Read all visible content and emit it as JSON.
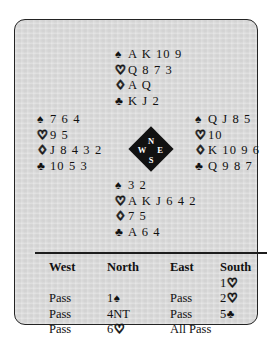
{
  "diagram": {
    "card_background": "#d8d8d8",
    "border_color": "#232323",
    "suit_glyphs": {
      "spade": "♠",
      "heart": "♡",
      "diamond": "♢",
      "club": "♣"
    },
    "compass": {
      "north": "N",
      "west": "W",
      "east": "E",
      "south": "S"
    },
    "hands": {
      "north": {
        "label": "North",
        "spades_sym": "♠",
        "spades": "A K 10 9",
        "hearts_sym": "♡",
        "hearts": "Q 8 7 3",
        "diamonds_sym": "♢",
        "diamonds": "A Q",
        "clubs_sym": "♣",
        "clubs": "K J 2"
      },
      "west": {
        "label": "West",
        "spades_sym": "♠",
        "spades": "7 6 4",
        "hearts_sym": "♡",
        "hearts": "9 5",
        "diamonds_sym": "♢",
        "diamonds": "J 8 4 3 2",
        "clubs_sym": "♣",
        "clubs": "10 5 3"
      },
      "east": {
        "label": "East",
        "spades_sym": "♠",
        "spades": "Q J 8 5",
        "hearts_sym": "♡",
        "hearts": "10",
        "diamonds_sym": "♢",
        "diamonds": "K 10 9 6",
        "clubs_sym": "♣",
        "clubs": "Q 9 8 7"
      },
      "south": {
        "label": "South",
        "spades_sym": "♠",
        "spades": "3 2",
        "hearts_sym": "♡",
        "hearts": "A K J 6 4 2",
        "diamonds_sym": "♢",
        "diamonds": "7 5",
        "clubs_sym": "♣",
        "clubs": "A 6 4"
      }
    },
    "auction": {
      "headers": {
        "west": "West",
        "north": "North",
        "east": "East",
        "south": "South"
      },
      "rows": [
        {
          "west": "",
          "north": "",
          "east": "",
          "south_level": "1",
          "south_sym": "♡"
        },
        {
          "west": "Pass",
          "north_level": "1",
          "north_sym": "♠",
          "east": "Pass",
          "south_level": "2",
          "south_sym": "♡"
        },
        {
          "west": "Pass",
          "north_level": "4NT",
          "north_sym": "",
          "east": "Pass",
          "south_level": "5",
          "south_sym": "♣"
        },
        {
          "west": "Pass",
          "north_level": "6",
          "north_sym": "♡",
          "east": "All Pass",
          "south_level": "",
          "south_sym": ""
        }
      ]
    }
  }
}
